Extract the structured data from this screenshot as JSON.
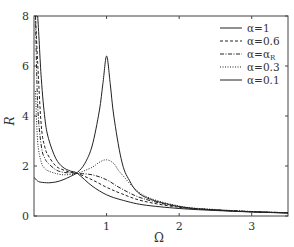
{
  "chart_data": {
    "type": "line",
    "title": "",
    "xlabel": "Ω",
    "ylabel": "R",
    "xlim": [
      0,
      3.5
    ],
    "ylim": [
      0,
      8
    ],
    "xticks": [
      1,
      2,
      3
    ],
    "xtick_labels": [
      "1",
      "2",
      "3"
    ],
    "yticks": [
      0,
      2,
      4,
      6,
      8
    ],
    "ytick_labels": [
      "0",
      "2",
      "4",
      "6",
      "8"
    ],
    "grid": false,
    "legend_position": "upper right",
    "series": [
      {
        "name": "α=1",
        "style": "solid",
        "x": [
          0.02,
          0.05,
          0.1,
          0.15,
          0.2,
          0.3,
          0.4,
          0.5,
          0.6,
          0.8,
          1.0,
          1.2,
          1.5,
          2.0,
          2.5,
          3.0,
          3.5
        ],
        "y": [
          8.0,
          8.0,
          5.5,
          3.9,
          3.1,
          2.3,
          1.95,
          1.8,
          1.7,
          1.2,
          0.85,
          0.65,
          0.45,
          0.3,
          0.22,
          0.16,
          0.12
        ]
      },
      {
        "name": "α=0.6",
        "style": "dashed",
        "x": [
          0.02,
          0.05,
          0.1,
          0.15,
          0.2,
          0.3,
          0.4,
          0.5,
          0.6,
          0.8,
          1.0,
          1.2,
          1.5,
          2.0,
          2.5,
          3.0,
          3.5
        ],
        "y": [
          8.0,
          6.2,
          3.6,
          2.75,
          2.4,
          2.0,
          1.85,
          1.75,
          1.7,
          1.45,
          1.15,
          0.9,
          0.6,
          0.35,
          0.24,
          0.17,
          0.13
        ]
      },
      {
        "name": "α=α_R",
        "style": "dashdot",
        "x": [
          0.02,
          0.05,
          0.1,
          0.15,
          0.2,
          0.3,
          0.4,
          0.5,
          0.6,
          0.8,
          1.0,
          1.2,
          1.5,
          2.0,
          2.5,
          3.0,
          3.5
        ],
        "y": [
          8.0,
          4.5,
          2.8,
          2.3,
          2.1,
          1.85,
          1.75,
          1.72,
          1.7,
          1.65,
          1.45,
          1.1,
          0.7,
          0.37,
          0.25,
          0.18,
          0.13
        ]
      },
      {
        "name": "α=0.3",
        "style": "dotted",
        "x": [
          0.02,
          0.05,
          0.1,
          0.15,
          0.2,
          0.3,
          0.4,
          0.5,
          0.6,
          0.8,
          0.9,
          1.0,
          1.1,
          1.2,
          1.5,
          2.0,
          2.5,
          3.0,
          3.5
        ],
        "y": [
          5.0,
          3.0,
          2.15,
          1.9,
          1.8,
          1.7,
          1.65,
          1.66,
          1.7,
          1.95,
          2.15,
          2.25,
          2.1,
          1.7,
          0.85,
          0.4,
          0.26,
          0.18,
          0.13
        ]
      },
      {
        "name": "α=0.1",
        "style": "solid",
        "x": [
          0.0,
          0.05,
          0.1,
          0.2,
          0.3,
          0.4,
          0.5,
          0.6,
          0.7,
          0.8,
          0.9,
          0.95,
          1.0,
          1.05,
          1.1,
          1.2,
          1.3,
          1.5,
          2.0,
          2.5,
          3.0,
          3.5
        ],
        "y": [
          1.55,
          1.4,
          1.35,
          1.33,
          1.36,
          1.45,
          1.58,
          1.75,
          2.1,
          2.8,
          4.2,
          5.3,
          6.4,
          5.3,
          4.0,
          2.3,
          1.5,
          0.8,
          0.38,
          0.24,
          0.17,
          0.12
        ]
      }
    ]
  },
  "axes": {
    "xlabel": "Ω",
    "ylabel": "R",
    "ytick_labels": [
      "0",
      "2",
      "4",
      "6",
      "8"
    ],
    "xtick_labels": [
      "1",
      "2",
      "3"
    ]
  },
  "legend": {
    "entries": [
      "α=1",
      "α=0.6",
      "α=α",
      "α=0.3",
      "α=0.1"
    ],
    "subscript_3": "R"
  }
}
